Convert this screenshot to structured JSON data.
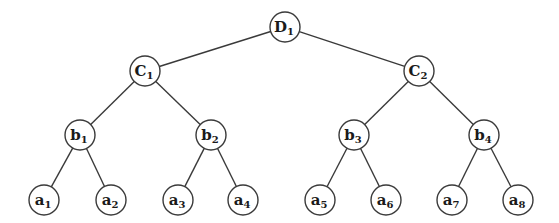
{
  "diagram": {
    "type": "binary-tree",
    "levels": 4,
    "node_radius": 15,
    "colors": {
      "stroke": "#3a3a3a",
      "fill": "#ffffff",
      "text": "#1a1a1a"
    },
    "nodes": [
      {
        "id": "D1",
        "base": "D",
        "sub": "1",
        "x": 285,
        "y": 27
      },
      {
        "id": "C1",
        "base": "C",
        "sub": "1",
        "x": 145,
        "y": 71
      },
      {
        "id": "C2",
        "base": "C",
        "sub": "2",
        "x": 419,
        "y": 71
      },
      {
        "id": "b1",
        "base": "b",
        "sub": "1",
        "x": 80,
        "y": 135
      },
      {
        "id": "b2",
        "base": "b",
        "sub": "2",
        "x": 211,
        "y": 135
      },
      {
        "id": "b3",
        "base": "b",
        "sub": "3",
        "x": 354,
        "y": 135
      },
      {
        "id": "b4",
        "base": "b",
        "sub": "4",
        "x": 484,
        "y": 135
      },
      {
        "id": "a1",
        "base": "a",
        "sub": "1",
        "x": 44,
        "y": 200
      },
      {
        "id": "a2",
        "base": "a",
        "sub": "2",
        "x": 111,
        "y": 200
      },
      {
        "id": "a3",
        "base": "a",
        "sub": "3",
        "x": 178,
        "y": 200
      },
      {
        "id": "a4",
        "base": "a",
        "sub": "4",
        "x": 243,
        "y": 200
      },
      {
        "id": "a5",
        "base": "a",
        "sub": "5",
        "x": 320,
        "y": 200
      },
      {
        "id": "a6",
        "base": "a",
        "sub": "6",
        "x": 386,
        "y": 200
      },
      {
        "id": "a7",
        "base": "a",
        "sub": "7",
        "x": 452,
        "y": 200
      },
      {
        "id": "a8",
        "base": "a",
        "sub": "8",
        "x": 518,
        "y": 200
      }
    ],
    "edges": [
      [
        "D1",
        "C1"
      ],
      [
        "D1",
        "C2"
      ],
      [
        "C1",
        "b1"
      ],
      [
        "C1",
        "b2"
      ],
      [
        "C2",
        "b3"
      ],
      [
        "C2",
        "b4"
      ],
      [
        "b1",
        "a1"
      ],
      [
        "b1",
        "a2"
      ],
      [
        "b2",
        "a3"
      ],
      [
        "b2",
        "a4"
      ],
      [
        "b3",
        "a5"
      ],
      [
        "b3",
        "a6"
      ],
      [
        "b4",
        "a7"
      ],
      [
        "b4",
        "a8"
      ]
    ]
  }
}
